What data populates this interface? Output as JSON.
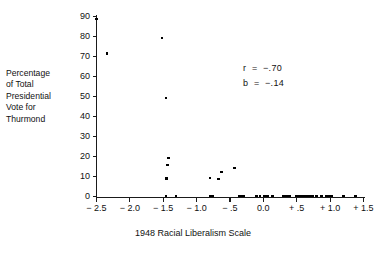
{
  "figure": {
    "background": "#ffffff",
    "ink": "#000000"
  },
  "annotations": [
    {
      "name": "correlation",
      "text": "r  =  −.70"
    },
    {
      "name": "slope",
      "text": "b  =  −.14"
    }
  ],
  "chart_data": {
    "type": "scatter",
    "title": "",
    "xlabel": "1948 Racial Liberalism Scale",
    "ylabel": "Percentage\nof Total\nPresidential\nVote for\nThurmond",
    "xlim": [
      -2.5,
      1.5
    ],
    "ylim": [
      0,
      90
    ],
    "grid": false,
    "legend": "none",
    "xticks": [
      -2.5,
      -2.0,
      -1.5,
      -1.0,
      -0.5,
      0.0,
      0.5,
      1.0,
      1.5
    ],
    "xticklabels": [
      "− 2.5",
      "− 2.0",
      "− 1.5",
      "− 1.0",
      "− .5",
      "0.0",
      "+ .5",
      "+ 1.0",
      "+ 1.5"
    ],
    "yticks": [
      0,
      10,
      20,
      30,
      40,
      50,
      60,
      70,
      80,
      90
    ],
    "yticklabels": [
      "0",
      "10",
      "20",
      "30",
      "40",
      "50",
      "60",
      "70",
      "80",
      "90"
    ],
    "series": [
      {
        "name": "states",
        "marker": "square",
        "color": "#000000",
        "points": [
          [
            -2.5,
            88.7
          ],
          [
            -2.34,
            71.6
          ],
          [
            -1.52,
            79.4
          ],
          [
            -1.46,
            49.3
          ],
          [
            -1.42,
            19.4
          ],
          [
            -1.44,
            15.7
          ],
          [
            -1.45,
            9.0
          ],
          [
            -1.46,
            0.4
          ],
          [
            -1.31,
            0.4
          ],
          [
            -0.8,
            9.3
          ],
          [
            -0.79,
            0.4
          ],
          [
            -0.76,
            0.4
          ],
          [
            -0.67,
            8.9
          ],
          [
            -0.63,
            12.4
          ],
          [
            -0.43,
            14.2
          ],
          [
            -0.36,
            0.4
          ],
          [
            -0.33,
            0.4
          ],
          [
            -0.3,
            0.4
          ],
          [
            -0.1,
            0.4
          ],
          [
            -0.05,
            0.4
          ],
          [
            0.02,
            0.4
          ],
          [
            0.06,
            0.4
          ],
          [
            0.14,
            0.4
          ],
          [
            0.3,
            0.4
          ],
          [
            0.33,
            0.4
          ],
          [
            0.36,
            0.4
          ],
          [
            0.4,
            0.4
          ],
          [
            0.49,
            0.4
          ],
          [
            0.52,
            0.4
          ],
          [
            0.55,
            0.4
          ],
          [
            0.58,
            0.4
          ],
          [
            0.61,
            0.4
          ],
          [
            0.64,
            0.4
          ],
          [
            0.67,
            0.4
          ],
          [
            0.7,
            0.4
          ],
          [
            0.74,
            0.4
          ],
          [
            0.8,
            0.4
          ],
          [
            0.87,
            0.4
          ],
          [
            0.94,
            0.4
          ],
          [
            0.97,
            0.4
          ],
          [
            1.0,
            0.4
          ],
          [
            1.03,
            0.4
          ],
          [
            1.2,
            0.4
          ],
          [
            1.38,
            0.4
          ]
        ]
      }
    ]
  }
}
